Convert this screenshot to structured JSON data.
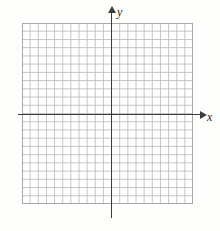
{
  "figure": {
    "kind": "blank-cartesian-coordinate-grid",
    "background_color": "#fdfdfb",
    "width_px": 220,
    "height_px": 231
  },
  "grid": {
    "left_px": 22,
    "top_px": 23,
    "width_px": 171,
    "height_px": 181,
    "columns": 21,
    "rows": 22,
    "cell_size_px": 8.15,
    "line_color": "#b7b7b7",
    "border_color": "#9a9a9a"
  },
  "axes": {
    "color": "#3b3b3b",
    "x": {
      "label": "x",
      "label_style": "italic",
      "orientation": "horizontal",
      "pixel_y": 114,
      "start_px": 18,
      "end_px": 204,
      "arrow_direction": "right",
      "label_x_px": 207,
      "label_y_px": 111
    },
    "y": {
      "label": "y",
      "label_style": "italic",
      "orientation": "vertical",
      "pixel_x": 111,
      "start_px": 11,
      "end_px": 218,
      "arrow_direction": "up",
      "label_x_px": 117,
      "label_y_px": 6
    },
    "origin": {
      "x_px": 111,
      "y_px": 114
    }
  },
  "chart_data": {
    "type": "scatter",
    "title": "",
    "xlabel": "x",
    "ylabel": "y",
    "series": [
      {
        "name": "",
        "x": [],
        "y": []
      }
    ],
    "xlim": [
      -11,
      10
    ],
    "ylim": [
      -11,
      11
    ],
    "grid": true,
    "legend": "none",
    "tick_labels_x": [],
    "tick_labels_y": [],
    "annotations": [],
    "note": "Empty graph paper: square grid with unlabeled x and y axes, no plotted data."
  }
}
